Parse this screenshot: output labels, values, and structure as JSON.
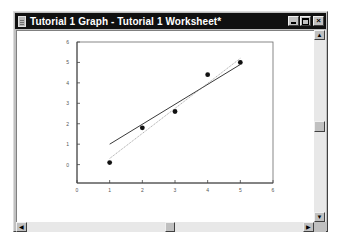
{
  "window": {
    "title": "Tutorial 1 Graph - Tutorial 1 Worksheet*",
    "buttons": {
      "minimize": "_",
      "maximize": "□",
      "close": "×"
    }
  },
  "scrollbars": {
    "vertical": {
      "up_arrow": "▲",
      "down_arrow": "▼"
    },
    "horizontal": {
      "left_arrow": "◀",
      "right_arrow": "▶"
    }
  },
  "chart_data": {
    "type": "scatter",
    "title": "",
    "xlabel": "",
    "ylabel": "",
    "xlim": [
      0,
      6
    ],
    "ylim": [
      -0.9,
      6
    ],
    "x_ticks": [
      "0",
      "1",
      "2",
      "3",
      "4",
      "5",
      "6"
    ],
    "y_ticks": [
      "0",
      "1",
      "2",
      "3",
      "4",
      "5",
      "6"
    ],
    "grid": false,
    "legend": null,
    "series": [
      {
        "name": "data",
        "kind": "points",
        "x": [
          1,
          2,
          3,
          4,
          5
        ],
        "y": [
          0.1,
          1.8,
          2.6,
          4.4,
          5.0
        ]
      },
      {
        "name": "regression",
        "kind": "line",
        "x": [
          1,
          5
        ],
        "y": [
          1.0,
          4.9
        ]
      },
      {
        "name": "fit-2",
        "kind": "dotted-line",
        "x": [
          1,
          5
        ],
        "y": [
          0.3,
          5.2
        ]
      }
    ]
  }
}
